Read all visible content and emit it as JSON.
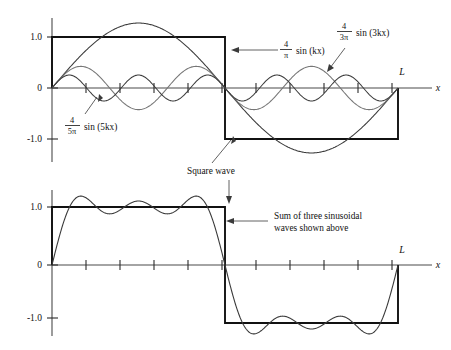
{
  "figure": {
    "title_internal": "Fourier synthesis of a square wave",
    "background_color": "#ffffff"
  },
  "chart_data": [
    {
      "type": "line",
      "panel": "top",
      "title": "",
      "xlabel": "x",
      "ylabel": "",
      "xlim": [
        0,
        1
      ],
      "ylim": [
        -1.45,
        1.45
      ],
      "grid": false,
      "legend": "annotations",
      "xtick_labels": [
        "L"
      ],
      "xtick_positions": [
        1.0
      ],
      "ytick_labels": [
        "1.0",
        "0",
        "-1.0"
      ],
      "ytick_values": [
        1.0,
        0,
        -1.0
      ],
      "series": [
        {
          "name": "Square wave",
          "kind": "square",
          "amplitude": 1.0,
          "period_fraction": 1.0,
          "color": "#111111",
          "description": "Square wave of amplitude 1.0, positive on first half of L, negative on second half"
        },
        {
          "name": "first-harmonic",
          "expression": "(4/pi) sin (kx)",
          "coefficient": 1.2732,
          "harmonic": 1,
          "color": "#3a3a3a"
        },
        {
          "name": "third-harmonic",
          "expression": "(4/3pi) sin (3kx)",
          "coefficient": 0.4244,
          "harmonic": 3,
          "color": "#767676"
        },
        {
          "name": "fifth-harmonic",
          "expression": "(4/5pi) sin (5kx)",
          "coefficient": 0.2546,
          "harmonic": 5,
          "color": "#3a3a3a"
        }
      ]
    },
    {
      "type": "line",
      "panel": "bottom",
      "title": "",
      "xlabel": "x",
      "ylabel": "",
      "xlim": [
        0,
        1
      ],
      "ylim": [
        -1.45,
        1.45
      ],
      "grid": false,
      "xtick_labels": [
        "L"
      ],
      "xtick_positions": [
        1.0
      ],
      "ytick_labels": [
        "1.0",
        "0",
        "-1.0"
      ],
      "ytick_values": [
        1.0,
        0,
        -1.0
      ],
      "series": [
        {
          "name": "Square wave",
          "kind": "square",
          "amplitude": 1.0,
          "color": "#111111"
        },
        {
          "name": "Sum of three sinusoidal waves shown above",
          "kind": "partial-fourier-sum",
          "harmonics": [
            1,
            3,
            5
          ],
          "coefficients": [
            1.2732,
            0.4244,
            0.2546
          ],
          "color": "#3a3a3a"
        }
      ]
    }
  ],
  "top_panel": {
    "y_ticks": [
      {
        "label": "1.0",
        "value": 1.0
      },
      {
        "label": "0",
        "value": 0
      },
      {
        "label": "-1.0",
        "value": -1.0
      }
    ],
    "x_axis_label": "x",
    "end_label": "L",
    "annotations": [
      {
        "id": "first-harmonic",
        "frac_numerator": "4",
        "frac_denominator": "π",
        "text": "sin (kx)"
      },
      {
        "id": "third-harmonic",
        "frac_numerator": "4",
        "frac_denominator": "3π",
        "text": "sin (3kx)"
      },
      {
        "id": "fifth-harmonic",
        "frac_numerator": "4",
        "frac_denominator": "5π",
        "text": "sin (5kx)"
      },
      {
        "id": "square-wave",
        "text": "Square wave"
      }
    ]
  },
  "bottom_panel": {
    "y_ticks": [
      {
        "label": "1.0",
        "value": 1.0
      },
      {
        "label": "0",
        "value": 0
      },
      {
        "label": "-1.0",
        "value": -1.0
      }
    ],
    "x_axis_label": "x",
    "end_label": "L",
    "annotations": [
      {
        "id": "sum-of-waves",
        "line1": "Sum of three sinusoidal",
        "line2": "waves shown above"
      }
    ]
  }
}
